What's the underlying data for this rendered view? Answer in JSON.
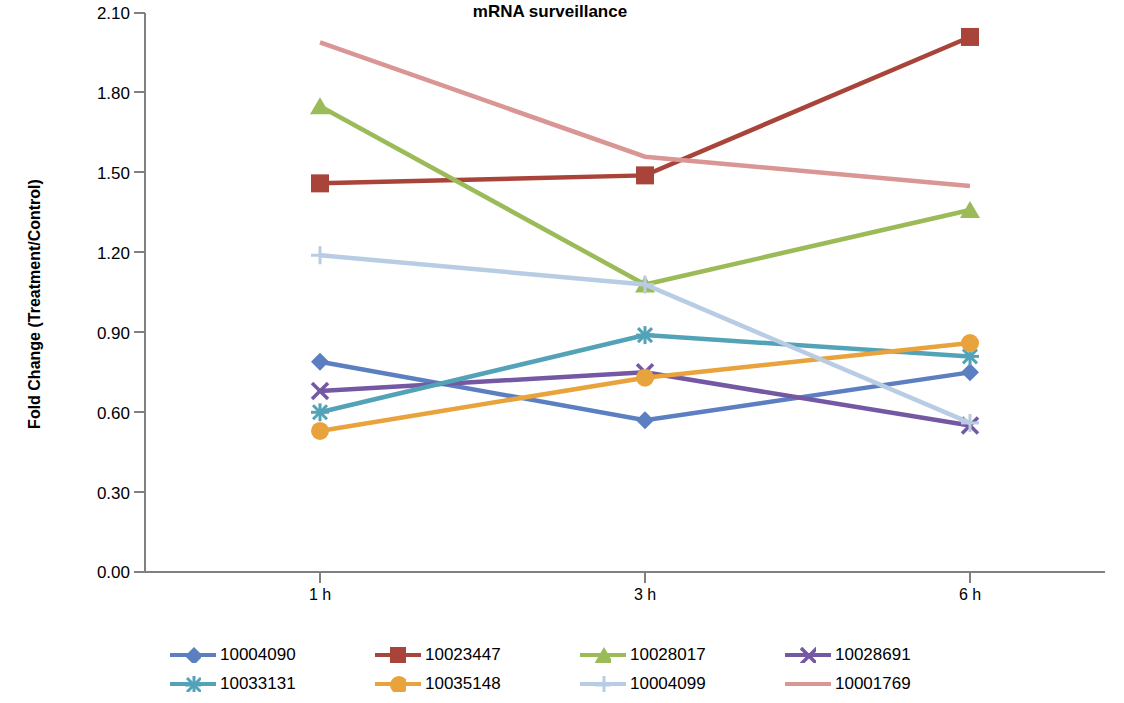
{
  "chart_data": {
    "type": "line",
    "title": "mRNA surveillance",
    "xlabel": "",
    "ylabel": "Fold Change (Treatment/Control)",
    "categories": [
      "1 h",
      "3 h",
      "6 h"
    ],
    "ylim": [
      0.0,
      2.1
    ],
    "yticks": [
      "0.00",
      "0.30",
      "0.60",
      "0.90",
      "1.20",
      "1.50",
      "1.80",
      "2.10"
    ],
    "ytick_values": [
      0.0,
      0.3,
      0.6,
      0.9,
      1.2,
      1.5,
      1.8,
      2.1
    ],
    "grid": false,
    "legend_position": "bottom",
    "series": [
      {
        "name": "10004090",
        "values": [
          0.79,
          0.57,
          0.75
        ],
        "color": "#5B7FC0",
        "marker": "diamond"
      },
      {
        "name": "10023447",
        "values": [
          1.46,
          1.49,
          2.01
        ],
        "color": "#A8443A",
        "marker": "square"
      },
      {
        "name": "10028017",
        "values": [
          1.75,
          1.08,
          1.36
        ],
        "color": "#9BBB59",
        "marker": "triangle"
      },
      {
        "name": "10028691",
        "values": [
          0.68,
          0.75,
          0.55
        ],
        "color": "#7558A3",
        "marker": "x"
      },
      {
        "name": "10033131",
        "values": [
          0.6,
          0.89,
          0.81
        ],
        "color": "#53A3B8",
        "marker": "star"
      },
      {
        "name": "10035148",
        "values": [
          0.53,
          0.73,
          0.86
        ],
        "color": "#E8A33D",
        "marker": "circle"
      },
      {
        "name": "10004099",
        "values": [
          1.19,
          1.08,
          0.56
        ],
        "color": "#B8CCE4",
        "marker": "plus"
      },
      {
        "name": "10001769",
        "values": [
          1.99,
          1.56,
          1.45
        ],
        "color": "#D99694",
        "marker": "none"
      }
    ]
  },
  "axes": {
    "axis_color": "#808080",
    "text_color": "#000000"
  }
}
